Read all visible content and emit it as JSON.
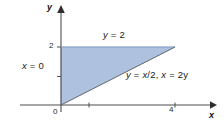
{
  "figure": {
    "background_color": "#ffffff",
    "region_fill_color": "#aabfdd",
    "region_edge_color": "#7f9dc4",
    "axis_color": "#4d4d4d",
    "text_color": "#1a1a1a"
  },
  "axes": {
    "x_axis_label": "x",
    "y_axis_label": "y",
    "origin_label": "0",
    "x_ticks": [
      {
        "value": 2,
        "label": ""
      },
      {
        "value": 4,
        "label": "4"
      }
    ],
    "y_ticks": [
      {
        "value": 1,
        "label": ""
      },
      {
        "value": 2,
        "label": "2"
      }
    ],
    "x_range": [
      -1.5,
      5.5
    ],
    "y_range": [
      -0.4,
      3.4
    ]
  },
  "annotations": {
    "top_boundary": "y = 2",
    "left_boundary": "x = 0",
    "diagonal_boundary": "y = x/2, x = 2y"
  },
  "chart_data": {
    "type": "area",
    "title": "",
    "xlabel": "x",
    "ylabel": "y",
    "xlim": [
      -1.5,
      5.5
    ],
    "ylim": [
      -0.4,
      3.4
    ],
    "grid": false,
    "legend": "none",
    "shaded_region": {
      "name": "triangular-region",
      "vertices": [
        [
          0,
          0
        ],
        [
          0,
          2
        ],
        [
          4,
          2
        ]
      ],
      "fill": "#aabfdd",
      "boundaries": [
        "y = 2",
        "x = 0",
        "y = x/2"
      ]
    },
    "curves": [
      {
        "name": "y = 2",
        "type": "horizontal-line",
        "y": 2,
        "x_from": 0,
        "x_to": 4
      },
      {
        "name": "x = 0",
        "type": "vertical-line",
        "x": 0,
        "y_from": 0,
        "y_to": 2
      },
      {
        "name": "y = x/2",
        "type": "line",
        "slope": 0.5,
        "intercept": 0,
        "x_from": 0,
        "x_to": 4
      }
    ],
    "tick_labels": {
      "x": [
        "0",
        "4"
      ],
      "y": [
        "2"
      ]
    }
  }
}
